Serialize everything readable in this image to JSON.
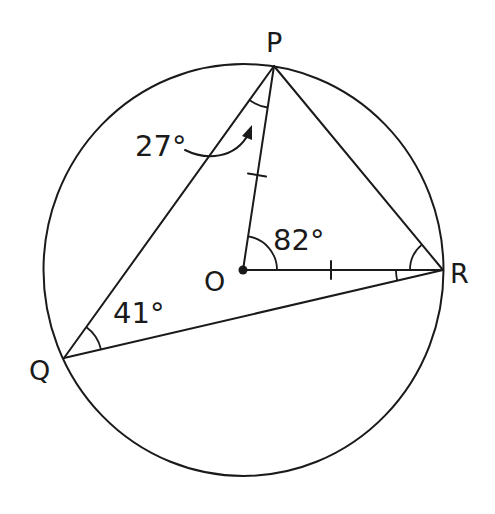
{
  "figure": {
    "colors": {
      "ink": "#1a1a1a",
      "background": "#ffffff"
    }
  },
  "points": {
    "P": {
      "label": "P",
      "x": 274,
      "y": 66
    },
    "Q": {
      "label": "Q",
      "x": 64,
      "y": 358
    },
    "R": {
      "label": "R",
      "x": 443,
      "y": 270
    },
    "O": {
      "label": "O",
      "x": 243,
      "y": 270
    }
  },
  "circle": {
    "centre": "O",
    "cx": 243.5,
    "cy": 270,
    "rx": 200,
    "ry": 206
  },
  "segments": [
    "PQ",
    "PR",
    "QR",
    "OP",
    "OR"
  ],
  "equal_marks": [
    "OP",
    "OR"
  ],
  "angles": {
    "QPO": {
      "label": "27°",
      "vertex": "P",
      "note": "indicated with curved arrow"
    },
    "POR": {
      "label": "82°",
      "vertex": "O"
    },
    "PQR": {
      "label": "41°",
      "vertex": "Q"
    },
    "ORP": {
      "label": "",
      "vertex": "R",
      "note": "marked, unlabelled"
    },
    "ORQ": {
      "label": "",
      "vertex": "R",
      "note": "marked, unlabelled"
    }
  }
}
